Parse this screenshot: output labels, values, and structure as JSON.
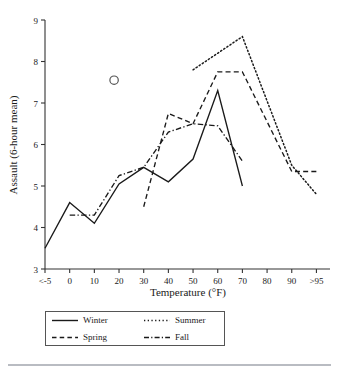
{
  "chart_data": {
    "type": "line",
    "title": "",
    "xlabel": "Temperature (°F)",
    "ylabel": "Assault (6-hour mean)",
    "x_tick_labels": [
      "<-5",
      "0",
      "10",
      "20",
      "30",
      "40",
      "50",
      "60",
      "70",
      "80",
      "90",
      ">95"
    ],
    "y_tick_labels": [
      "3",
      "4",
      "5",
      "6",
      "7",
      "8",
      "9"
    ],
    "ylim": [
      3,
      9
    ],
    "grid": false,
    "legend_position": "below-plot",
    "series": [
      {
        "name": "Winter",
        "style": "solid",
        "x": [
          "<-5",
          "0",
          "10",
          "20",
          "30",
          "40",
          "50",
          "60",
          "70"
        ],
        "values": [
          3.5,
          4.6,
          4.1,
          5.05,
          5.45,
          5.1,
          5.65,
          7.3,
          5.0
        ]
      },
      {
        "name": "Spring",
        "style": "dashed",
        "x": [
          "30",
          "40",
          "50",
          "60",
          "70",
          "90",
          ">95"
        ],
        "values": [
          4.5,
          6.75,
          6.5,
          7.75,
          7.75,
          5.35,
          5.35
        ]
      },
      {
        "name": "Summer",
        "style": "dotted",
        "x": [
          "50",
          "70",
          "90",
          ">95"
        ],
        "values": [
          7.8,
          8.6,
          5.5,
          4.8
        ]
      },
      {
        "name": "Fall",
        "style": "dash-dot",
        "x": [
          "0",
          "10",
          "20",
          "30",
          "40",
          "50",
          "60",
          "70"
        ],
        "values": [
          4.3,
          4.3,
          5.25,
          5.45,
          6.3,
          6.5,
          6.45,
          5.6
        ]
      }
    ],
    "annotations": [
      {
        "type": "circle-marker",
        "x": 18,
        "y": 7.55,
        "label": ""
      }
    ]
  },
  "legend": {
    "items": [
      {
        "label": "Winter",
        "style": "solid"
      },
      {
        "label": "Summer",
        "style": "dotted"
      },
      {
        "label": "Spring",
        "style": "dashed"
      },
      {
        "label": "Fall",
        "style": "dash-dot"
      }
    ]
  },
  "colors": {
    "ink": "#1a1a1a",
    "axis": "#333333",
    "background": "#ffffff",
    "rule": "#b9bcc2"
  }
}
